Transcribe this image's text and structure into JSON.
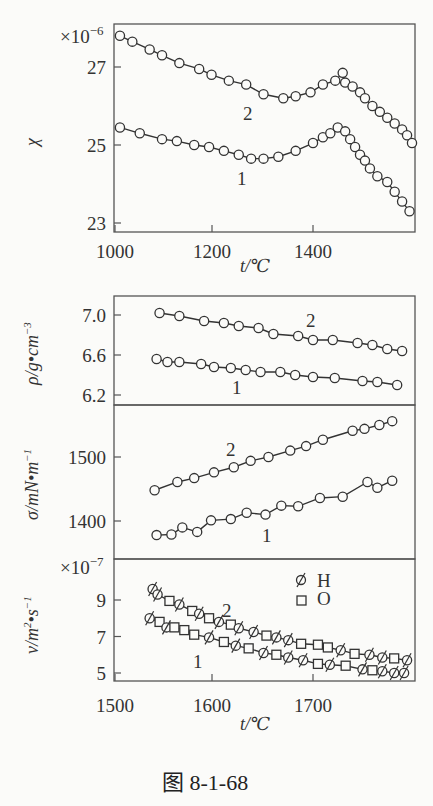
{
  "caption": "图 8-1-68",
  "chart_data": [
    {
      "type": "line",
      "panel": "top",
      "title": "",
      "xlabel": "t/℃",
      "ylabel": "χ",
      "y_multiplier": "×10⁻⁶",
      "xlim": [
        1000,
        1600
      ],
      "ylim": [
        22.8,
        28.6
      ],
      "xticks": [
        "1000",
        "1200",
        "1400"
      ],
      "yticks": [
        "23",
        "25",
        "27"
      ],
      "marker": "circle",
      "series": [
        {
          "name": "2",
          "x": [
            1010,
            1035,
            1070,
            1095,
            1130,
            1170,
            1195,
            1230,
            1265,
            1300,
            1340,
            1365,
            1395,
            1420,
            1445,
            1460,
            1465,
            1480,
            1495,
            1505,
            1520,
            1535,
            1550,
            1565,
            1580,
            1590,
            1600
          ],
          "values": [
            27.8,
            27.65,
            27.45,
            27.3,
            27.1,
            26.95,
            26.8,
            26.65,
            26.55,
            26.3,
            26.2,
            26.25,
            26.35,
            26.55,
            26.65,
            26.85,
            26.6,
            26.5,
            26.35,
            26.2,
            26.0,
            25.85,
            25.7,
            25.55,
            25.4,
            25.25,
            25.05
          ]
        },
        {
          "name": "1",
          "x": [
            1010,
            1050,
            1095,
            1125,
            1160,
            1190,
            1220,
            1250,
            1275,
            1300,
            1330,
            1365,
            1400,
            1420,
            1435,
            1450,
            1465,
            1475,
            1485,
            1495,
            1505,
            1515,
            1530,
            1550,
            1565,
            1580,
            1595
          ],
          "values": [
            25.45,
            25.3,
            25.15,
            25.1,
            25.0,
            24.95,
            24.85,
            24.75,
            24.65,
            24.65,
            24.7,
            24.85,
            25.05,
            25.2,
            25.3,
            25.45,
            25.35,
            25.15,
            24.95,
            24.75,
            24.6,
            24.4,
            24.2,
            24.05,
            23.8,
            23.55,
            23.3
          ]
        }
      ]
    },
    {
      "type": "line",
      "panel": "density",
      "xlabel": "t/℃",
      "ylabel": "ρ/g·cm⁻³",
      "xlim": [
        1500,
        1800
      ],
      "ylim": [
        6.12,
        7.18
      ],
      "yticks": [
        "6.2",
        "6.6",
        "7.0"
      ],
      "marker": "circle",
      "series": [
        {
          "name": "2",
          "x": [
            1545,
            1565,
            1590,
            1610,
            1625,
            1645,
            1660,
            1685,
            1700,
            1720,
            1745,
            1760,
            1775,
            1790
          ],
          "values": [
            7.02,
            6.99,
            6.94,
            6.92,
            6.89,
            6.87,
            6.81,
            6.79,
            6.75,
            6.75,
            6.72,
            6.7,
            6.66,
            6.64
          ]
        },
        {
          "name": "1",
          "x": [
            1542,
            1553,
            1565,
            1587,
            1600,
            1617,
            1632,
            1647,
            1667,
            1682,
            1700,
            1722,
            1750,
            1765,
            1785
          ],
          "values": [
            6.56,
            6.53,
            6.53,
            6.51,
            6.48,
            6.47,
            6.45,
            6.43,
            6.43,
            6.4,
            6.38,
            6.37,
            6.34,
            6.33,
            6.3
          ]
        }
      ]
    },
    {
      "type": "line",
      "panel": "surface_tension",
      "xlabel": "t/℃",
      "ylabel": "σ/mN·m⁻¹",
      "xlim": [
        1500,
        1800
      ],
      "ylim": [
        1350,
        1560
      ],
      "yticks": [
        "1400",
        "1500"
      ],
      "marker": "circle",
      "series": [
        {
          "name": "2",
          "x": [
            1540,
            1563,
            1580,
            1600,
            1620,
            1637,
            1655,
            1677,
            1693,
            1710,
            1740,
            1752,
            1767,
            1780
          ],
          "values": [
            1448,
            1461,
            1467,
            1476,
            1484,
            1494,
            1500,
            1510,
            1517,
            1527,
            1541,
            1544,
            1550,
            1556
          ]
        },
        {
          "name": "1",
          "x": [
            1542,
            1557,
            1568,
            1583,
            1597,
            1617,
            1633,
            1652,
            1668,
            1685,
            1707,
            1730,
            1755,
            1765,
            1780
          ],
          "values": [
            1378,
            1379,
            1390,
            1383,
            1401,
            1403,
            1413,
            1410,
            1424,
            1423,
            1436,
            1438,
            1461,
            1452,
            1463
          ]
        }
      ]
    },
    {
      "type": "line",
      "panel": "viscosity",
      "xlabel": "t/℃",
      "ylabel": "ν/m²·s⁻¹",
      "y_multiplier": "×10⁻⁷",
      "xlim": [
        1500,
        1800
      ],
      "ylim": [
        4.6,
        10.8
      ],
      "xticks": [
        "1500",
        "1600",
        "1700"
      ],
      "yticks": [
        "5",
        "7",
        "9"
      ],
      "legend": [
        {
          "marker": "slashed-circle",
          "label": "H"
        },
        {
          "marker": "square",
          "label": "O"
        }
      ],
      "series": [
        {
          "name": "2",
          "x": [
            1538,
            1543,
            1555,
            1565,
            1578,
            1585,
            1595,
            1605,
            1617,
            1625,
            1640,
            1653,
            1663,
            1675,
            1688,
            1705,
            1715,
            1728,
            1742,
            1757,
            1770,
            1782,
            1795
          ],
          "values": [
            9.6,
            9.3,
            8.95,
            8.75,
            8.4,
            8.25,
            8.0,
            7.8,
            7.65,
            7.45,
            7.25,
            7.05,
            6.95,
            6.8,
            6.6,
            6.55,
            6.4,
            6.25,
            6.05,
            6.0,
            5.85,
            5.8,
            5.7
          ],
          "markers": [
            "H",
            "H",
            "O",
            "H",
            "O",
            "H",
            "O",
            "H",
            "O",
            "H",
            "H",
            "O",
            "H",
            "H",
            "O",
            "O",
            "O",
            "H",
            "O",
            "H",
            "H",
            "O",
            "H"
          ]
        },
        {
          "name": "1",
          "x": [
            1535,
            1545,
            1552,
            1560,
            1570,
            1580,
            1595,
            1610,
            1622,
            1635,
            1650,
            1663,
            1675,
            1690,
            1705,
            1717,
            1733,
            1750,
            1760,
            1770,
            1782,
            1792
          ],
          "values": [
            8.0,
            7.8,
            7.5,
            7.5,
            7.35,
            7.1,
            6.95,
            6.7,
            6.5,
            6.35,
            6.1,
            6.0,
            5.85,
            5.7,
            5.5,
            5.45,
            5.4,
            5.2,
            5.15,
            5.1,
            5.0,
            5.0
          ],
          "markers": [
            "H",
            "O",
            "H",
            "O",
            "O",
            "O",
            "H",
            "O",
            "H",
            "O",
            "H",
            "O",
            "H",
            "H",
            "O",
            "H",
            "O",
            "H",
            "O",
            "H",
            "H",
            "H"
          ]
        }
      ]
    }
  ],
  "labels": {
    "top_y": "χ",
    "top_mult": "×10",
    "top_mult_exp": "−6",
    "top_x": "t/℃",
    "rho_y": "ρ/g•cm",
    "rho_exp": "−3",
    "sigma_y": "σ/mN•m",
    "sigma_exp": "−1",
    "nu_y": "ν/m",
    "nu_mid": "2",
    "nu_rest": "•s",
    "nu_exp": "−1",
    "nu_mult": "×10",
    "nu_mult_exp": "−7",
    "bottom_x": "t/℃",
    "curve1": "1",
    "curve2": "2",
    "legend_h": "H",
    "legend_o": "O"
  }
}
